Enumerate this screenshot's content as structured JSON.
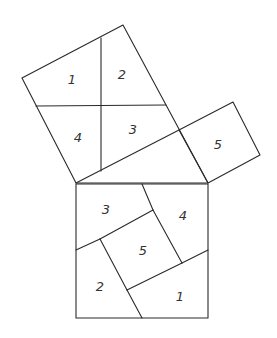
{
  "diagram": {
    "line_color": "#2a2a2a",
    "label_color": "#333333",
    "shapes": {
      "large_leg_square": {
        "vertices": [
          [
            22,
            78
          ],
          [
            123,
            25
          ],
          [
            208,
            183
          ],
          [
            76,
            183
          ]
        ],
        "cut_lines": [
          {
            "from": [
              101,
              38
            ],
            "to": [
              101,
              171
            ]
          },
          {
            "from": [
              36,
              106
            ],
            "to": [
              166,
              105
            ]
          }
        ],
        "pieces": [
          {
            "label": "1",
            "pos": [
              72,
              80
            ]
          },
          {
            "label": "2",
            "pos": [
              122,
              75
            ]
          },
          {
            "label": "4",
            "pos": [
              78,
              138
            ]
          },
          {
            "label": "3",
            "pos": [
              133,
              130
            ]
          }
        ]
      },
      "small_leg_square": {
        "vertices": [
          [
            179,
            130
          ],
          [
            233,
            102
          ],
          [
            260,
            155
          ],
          [
            208,
            183
          ]
        ],
        "pieces": [
          {
            "label": "5",
            "pos": [
              218,
              145
            ]
          }
        ]
      },
      "hypotenuse_line": {
        "from": [
          76,
          183
        ],
        "to": [
          179,
          130
        ]
      },
      "hypotenuse_square": {
        "vertices": [
          [
            76,
            184
          ],
          [
            208,
            184
          ],
          [
            208,
            318
          ],
          [
            76,
            318
          ]
        ],
        "cut_lines": [
          {
            "from": [
              142,
              184
            ],
            "to": [
              153,
              210
            ]
          },
          {
            "from": [
              153,
              210
            ],
            "to": [
              182,
              263
            ]
          },
          {
            "from": [
              182,
              263
            ],
            "to": [
              208,
              250
            ]
          },
          {
            "from": [
              76,
              250
            ],
            "to": [
              100,
              239
            ]
          },
          {
            "from": [
              100,
              239
            ],
            "to": [
              153,
              210
            ]
          },
          {
            "from": [
              100,
              239
            ],
            "to": [
              127,
              290
            ]
          },
          {
            "from": [
              127,
              290
            ],
            "to": [
              142,
              318
            ]
          },
          {
            "from": [
              127,
              290
            ],
            "to": [
              182,
              263
            ]
          }
        ],
        "pieces": [
          {
            "label": "3",
            "pos": [
              106,
              210
            ]
          },
          {
            "label": "4",
            "pos": [
              183,
              216
            ]
          },
          {
            "label": "5",
            "pos": [
              143,
              251
            ]
          },
          {
            "label": "2",
            "pos": [
              100,
              287
            ]
          },
          {
            "label": "1",
            "pos": [
              180,
              297
            ]
          }
        ]
      }
    }
  }
}
